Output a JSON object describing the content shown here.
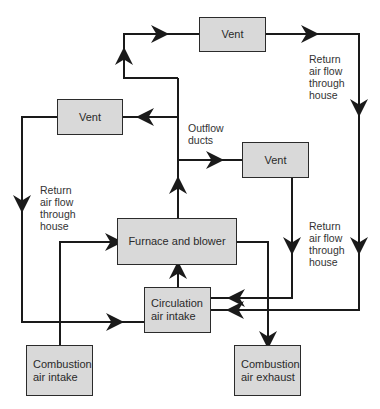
{
  "boxes": {
    "vent_top": "Vent",
    "vent_left": "Vent",
    "vent_right": "Vent",
    "furnace": "Furnace and blower",
    "circulation": "Circulation\nair intake",
    "combustion_intake": "Combustion\nair intake",
    "combustion_exhaust": "Combustion\nair exhaust"
  },
  "labels": {
    "outflow": "Outflow\nducts",
    "return_top_right": "Return\nair flow\nthrough\nhouse",
    "return_left": "Return\nair flow\nthrough\nhouse",
    "return_mid_right": "Return\nair flow\nthrough\nhouse"
  },
  "colors": {
    "box_fill": "#d9d9d9",
    "line": "#1a1a1a"
  }
}
